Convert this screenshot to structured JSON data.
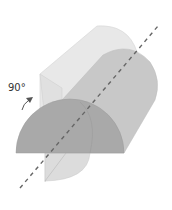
{
  "diagram": {
    "rotation_label": "90°",
    "colors": {
      "background": "#ffffff",
      "back_face": "#e4e4e4",
      "top_surface": "#dcdcdc",
      "front_body": "#c4c4c4",
      "front_face": "#a8a8a8",
      "lower_face": "#d8d8d8",
      "axis": "#666666",
      "arrow": "#555555",
      "edge": "#bdbdbd"
    }
  }
}
